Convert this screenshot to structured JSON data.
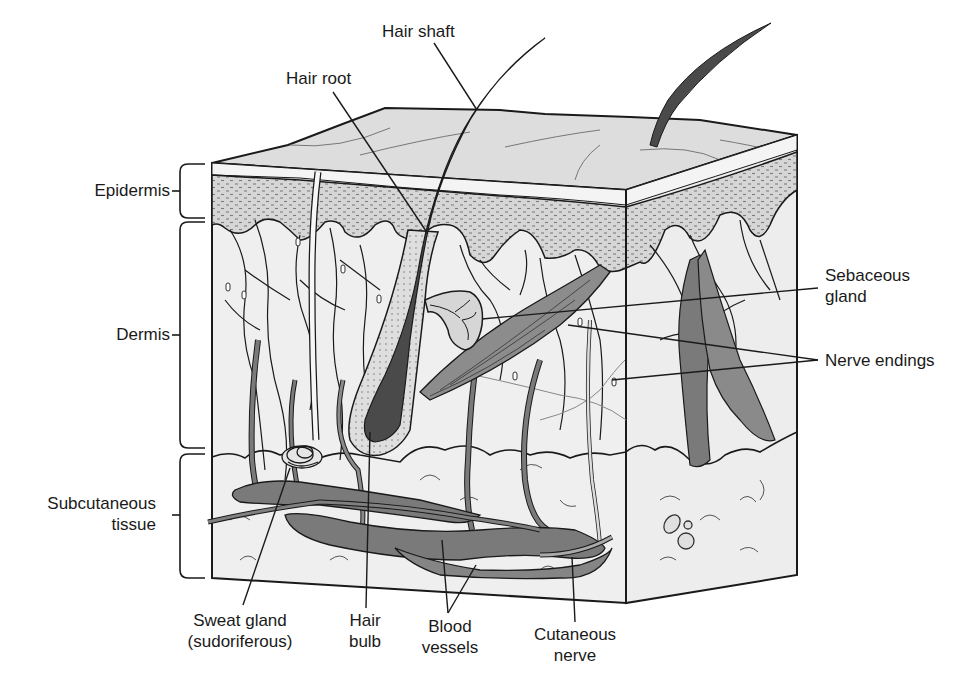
{
  "colors": {
    "outline": "#1a1a1a",
    "surface": "#dcdcdc",
    "epidermis_dots": "#8a8a8a",
    "dermis_fill": "#eeeeee",
    "vessel": "#777777",
    "hair": "#444444",
    "muscle": "#8c8c8c"
  },
  "labels": {
    "hair_shaft": "Hair shaft",
    "hair_root": "Hair root",
    "epidermis": "Epidermis",
    "dermis": "Dermis",
    "subcutaneous": {
      "line1": "Subcutaneous",
      "line2": "tissue"
    },
    "sebaceous_gland": {
      "line1": "Sebaceous",
      "line2": "gland"
    },
    "nerve_endings": "Nerve endings",
    "sweat_gland": {
      "line1": "Sweat gland",
      "line2": "(sudoriferous)"
    },
    "hair_bulb": {
      "line1": "Hair",
      "line2": "bulb"
    },
    "blood_vessels": {
      "line1": "Blood",
      "line2": "vessels"
    },
    "cutaneous_nerve": {
      "line1": "Cutaneous",
      "line2": "nerve"
    }
  }
}
